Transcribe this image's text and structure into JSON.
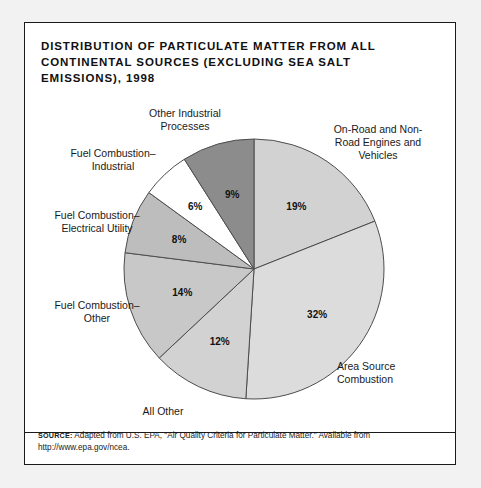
{
  "figure": {
    "title": "DISTRIBUTION OF PARTICULATE MATTER FROM ALL CONTINENTAL SOURCES (EXCLUDING SEA SALT EMISSIONS), 1998",
    "source_tag": "SOURCE:",
    "source_text": " Adapted from U.S. EPA, \"Air Quality Criteria for Particulate Matter.\" Available from http://www.epa.gov/ncea."
  },
  "chart_data": {
    "type": "pie",
    "title": "DISTRIBUTION OF PARTICULATE MATTER FROM ALL CONTINENTAL SOURCES (EXCLUDING SEA SALT EMISSIONS), 1998",
    "xlabel": "",
    "ylabel": "",
    "units": "percent",
    "start_angle_deg": 0,
    "direction": "clockwise",
    "legend": "none (direct labels with leader placement)",
    "categories": [
      "On-Road and Non-Road Engines and Vehicles",
      "Area Source Combustion",
      "All Other",
      "Fuel Combustion–Other",
      "Fuel Combustion–Electrical Utility",
      "Fuel Combustion–Industrial",
      "Other Industrial Processes"
    ],
    "values": [
      19,
      32,
      12,
      14,
      8,
      6,
      9
    ],
    "value_labels": [
      "19%",
      "32%",
      "12%",
      "14%",
      "8%",
      "6%",
      "9%"
    ],
    "colors": [
      "#d2d2d2",
      "#dcdcdc",
      "#d2d2d2",
      "#c8c8c8",
      "#bdbdbd",
      "#ffffff",
      "#8c8c8c"
    ],
    "slices": [
      {
        "label": "On-Road and Non-Road Engines and Vehicles",
        "label_lines": "On-Road and Non-\nRoad Engines and\nVehicles",
        "value": 19,
        "value_label": "19%",
        "color": "#d2d2d2"
      },
      {
        "label": "Area Source Combustion",
        "label_lines": "Area Source\nCombustion",
        "value": 32,
        "value_label": "32%",
        "color": "#dcdcdc"
      },
      {
        "label": "All Other",
        "label_lines": "All Other",
        "value": 12,
        "value_label": "12%",
        "color": "#d2d2d2"
      },
      {
        "label": "Fuel Combustion–Other",
        "label_lines": "Fuel Combustion–\nOther",
        "value": 14,
        "value_label": "14%",
        "color": "#c8c8c8"
      },
      {
        "label": "Fuel Combustion–Electrical Utility",
        "label_lines": "Fuel Combustion–\nElectrical Utility",
        "value": 8,
        "value_label": "8%",
        "color": "#bdbdbd"
      },
      {
        "label": "Fuel Combustion–Industrial",
        "label_lines": "Fuel Combustion–\nIndustrial",
        "value": 6,
        "value_label": "6%",
        "color": "#ffffff"
      },
      {
        "label": "Other Industrial Processes",
        "label_lines": "Other Industrial\nProcesses",
        "value": 9,
        "value_label": "9%",
        "color": "#8c8c8c"
      }
    ]
  }
}
